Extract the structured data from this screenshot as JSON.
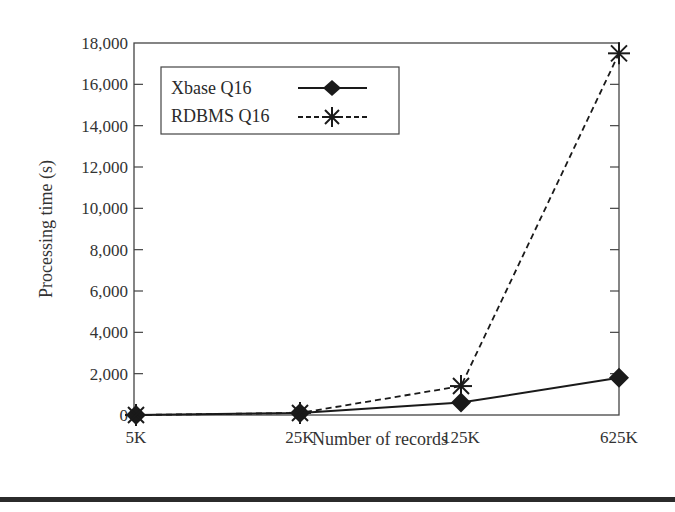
{
  "chart_data": {
    "type": "line",
    "title": "",
    "xlabel": "Number of records",
    "ylabel": "Processing time (s)",
    "categories": [
      "5K",
      "25K",
      "125K",
      "625K"
    ],
    "series": [
      {
        "name": "Xbase Q16",
        "line_style": "solid",
        "marker": "diamond",
        "values": [
          0,
          100,
          600,
          1800
        ]
      },
      {
        "name": "RDBMS Q16",
        "line_style": "dashed",
        "marker": "asterisk",
        "values": [
          0,
          100,
          1400,
          17500
        ]
      }
    ],
    "ylim": [
      0,
      18000
    ],
    "yticks": [
      0,
      2000,
      4000,
      6000,
      8000,
      10000,
      12000,
      14000,
      16000,
      18000
    ],
    "ytick_labels": [
      "0",
      "2,000",
      "4,000",
      "6,000",
      "8,000",
      "10,000",
      "12,000",
      "14,000",
      "16,000",
      "18,000"
    ],
    "grid": false,
    "legend_position": "upper left"
  },
  "legend": {
    "items": [
      {
        "label": "Xbase Q16"
      },
      {
        "label": "RDBMS Q16"
      }
    ]
  },
  "colors": {
    "line": "#1a1a1a",
    "axis": "#444444",
    "text": "#333333"
  }
}
